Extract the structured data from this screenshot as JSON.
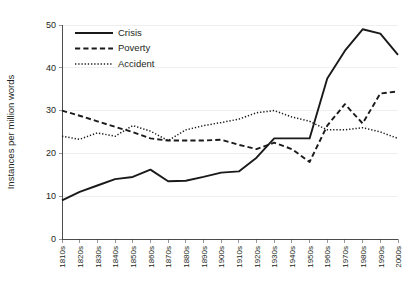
{
  "chart_data": {
    "type": "line",
    "title": "",
    "xlabel": "",
    "ylabel": "Instances per million words",
    "ylim": [
      0,
      50
    ],
    "yticks": [
      0,
      10,
      20,
      30,
      40,
      50
    ],
    "grid": true,
    "legend_position": "top-left",
    "categories": [
      "1810s",
      "1820s",
      "1830s",
      "1840s",
      "1850s",
      "1860s",
      "1870s",
      "1880s",
      "1890s",
      "1900s",
      "1910s",
      "1920s",
      "1930s",
      "1940s",
      "1950s",
      "1960s",
      "1970s",
      "1980s",
      "1990s",
      "2000s"
    ],
    "series": [
      {
        "name": "Crisis",
        "style": "solid",
        "values": [
          9.0,
          11.0,
          12.5,
          14.0,
          14.5,
          16.2,
          13.5,
          13.6,
          14.5,
          15.5,
          15.8,
          19.0,
          23.5,
          23.5,
          23.5,
          37.5,
          44.0,
          49.0,
          48.0,
          43.0
        ]
      },
      {
        "name": "Poverty",
        "style": "dashed",
        "values": [
          30.0,
          28.8,
          27.5,
          26.2,
          25.0,
          23.5,
          23.0,
          23.0,
          23.0,
          23.2,
          22.0,
          21.0,
          22.5,
          21.0,
          18.0,
          26.5,
          31.5,
          27.0,
          34.0,
          34.5
        ]
      },
      {
        "name": "Accident",
        "style": "dotted",
        "values": [
          24.0,
          23.3,
          24.8,
          24.0,
          26.5,
          25.2,
          23.0,
          25.5,
          26.5,
          27.2,
          28.0,
          29.5,
          30.0,
          28.5,
          27.5,
          25.5,
          25.5,
          26.0,
          25.0,
          23.5
        ]
      }
    ]
  },
  "legend": {
    "items": [
      {
        "label": "Crisis",
        "style": "solid"
      },
      {
        "label": "Poverty",
        "style": "dashed"
      },
      {
        "label": "Accident",
        "style": "dotted"
      }
    ]
  },
  "axes": {
    "y_title": "Instances per million words",
    "y_tick_labels": [
      "0",
      "10",
      "20",
      "30",
      "40",
      "50"
    ],
    "x_tick_labels": [
      "1810s",
      "1820s",
      "1830s",
      "1840s",
      "1850s",
      "1860s",
      "1870s",
      "1880s",
      "1890s",
      "1900s",
      "1910s",
      "1920s",
      "1930s",
      "1940s",
      "1950s",
      "1960s",
      "1970s",
      "1980s",
      "1990s",
      "2000s"
    ]
  }
}
